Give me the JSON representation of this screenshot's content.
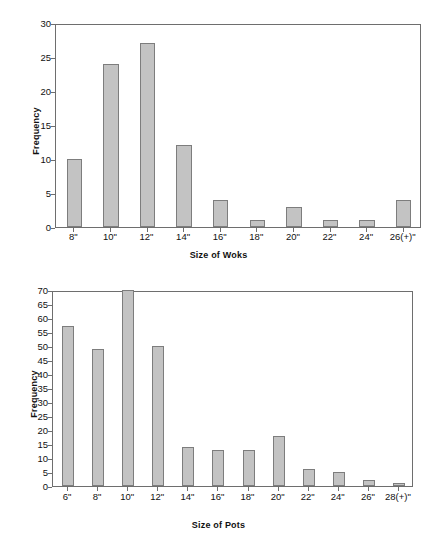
{
  "chart_data": [
    {
      "id": "woks",
      "type": "bar",
      "title": "",
      "xlabel": "Size of Woks",
      "ylabel": "Frequency",
      "categories": [
        "8\"",
        "10\"",
        "12\"",
        "14\"",
        "16\"",
        "18\"",
        "20\"",
        "22\"",
        "24\"",
        "26(+)\""
      ],
      "values": [
        10,
        24,
        27,
        12,
        4,
        1,
        3,
        1,
        1,
        4
      ],
      "ylim": [
        0,
        30
      ],
      "yticks": [
        0,
        5,
        10,
        15,
        20,
        25,
        30
      ],
      "grid": false,
      "legend": false,
      "bar_fill": "#c3c3c3",
      "bar_border": "#7d7d7d",
      "axis_color": "#6e6e6e"
    },
    {
      "id": "pots",
      "type": "bar",
      "title": "",
      "xlabel": "Size of Pots",
      "ylabel": "Frequency",
      "categories": [
        "6\"",
        "8\"",
        "10\"",
        "12\"",
        "14\"",
        "16\"",
        "18\"",
        "20\"",
        "22\"",
        "24\"",
        "26\"",
        "28(+)\""
      ],
      "values": [
        57,
        49,
        70,
        50,
        14,
        13,
        13,
        18,
        6,
        5,
        2,
        1
      ],
      "ylim": [
        0,
        70
      ],
      "yticks": [
        0,
        5,
        10,
        15,
        20,
        25,
        30,
        35,
        40,
        45,
        50,
        55,
        60,
        65,
        70
      ],
      "grid": false,
      "legend": false,
      "bar_fill": "#c3c3c3",
      "bar_border": "#7d7d7d",
      "axis_color": "#6e6e6e"
    }
  ]
}
